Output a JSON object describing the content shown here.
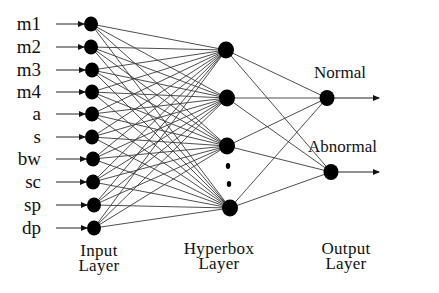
{
  "diagram": {
    "type": "neural-network",
    "layers": {
      "input": {
        "title_line1": "Input",
        "title_line2": "Layer",
        "nodes": [
          "m1",
          "m2",
          "m3",
          "m4",
          "a",
          "s",
          "bw",
          "sc",
          "sp",
          "dp"
        ]
      },
      "hyperbox": {
        "title_line1": "Hyperbox",
        "title_line2": "Layer",
        "visible_nodes": 4,
        "ellipsis": true
      },
      "output": {
        "title_line1": "Output",
        "title_line2": "Layer",
        "nodes": [
          "Normal",
          "Abnormal"
        ]
      }
    },
    "connections": "fully-connected between adjacent layers",
    "colors": {
      "node": "#000000",
      "edge": "#3a3a3a",
      "text": "#111111",
      "background": "#ffffff"
    }
  }
}
